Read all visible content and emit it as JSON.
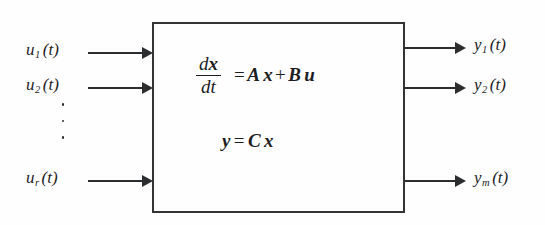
{
  "diagram": {
    "background_color": "#fefefe",
    "line_color": "#2c2d2f",
    "text_color": "#1d1d1f"
  },
  "block": {
    "name": "state-space-system-block",
    "border_color": "#333436"
  },
  "equations": {
    "state": {
      "fraction_numerator": "dx",
      "fraction_denominator": "dt",
      "equals": "=",
      "term_a_matrix": "A",
      "term_a_vector": "x",
      "plus": "+",
      "term_b_matrix": "B",
      "term_b_vector": "u"
    },
    "output": {
      "lhs": "y",
      "equals": "=",
      "matrix": "C",
      "vector": "x"
    }
  },
  "inputs": [
    {
      "base": "u",
      "subscript": "1",
      "argument": "(t)"
    },
    {
      "base": "u",
      "subscript": "2",
      "argument": "(t)"
    },
    {
      "base": "u",
      "subscript": "r",
      "argument": "(t)"
    }
  ],
  "outputs": [
    {
      "base": "y",
      "subscript": "1",
      "argument": "(t)"
    },
    {
      "base": "y",
      "subscript": "2",
      "argument": "(t)"
    },
    {
      "base": "y",
      "subscript": "m",
      "argument": "(t)"
    }
  ],
  "ellipsis": {
    "input_dots": "3 vertical dots"
  }
}
